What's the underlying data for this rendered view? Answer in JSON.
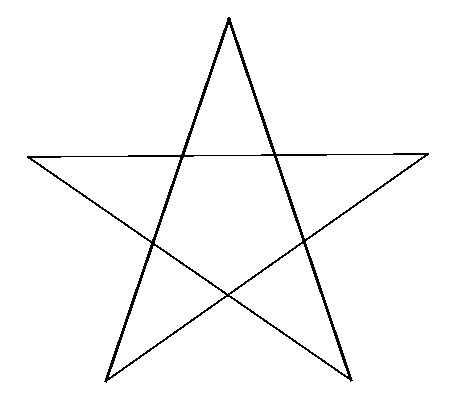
{
  "canvas": {
    "width": 449,
    "height": 408,
    "background": "#ffffff",
    "stroke_color": "#000000"
  },
  "star": {
    "points": {
      "top": [
        229,
        19
      ],
      "left": [
        28,
        157
      ],
      "right": [
        428,
        154
      ],
      "bottom_left": [
        106,
        381
      ],
      "bottom_right": [
        351,
        380
      ]
    },
    "segments": [
      {
        "name": "top-to-bottom-left",
        "from": "top",
        "to": "bottom_left",
        "width": 3
      },
      {
        "name": "top-to-bottom-right",
        "from": "top",
        "to": "bottom_right",
        "width": 3
      },
      {
        "name": "left-to-right",
        "from": "left",
        "to": "right",
        "width": 1.5
      },
      {
        "name": "left-to-bottom-right",
        "from": "left",
        "to": "bottom_right",
        "width": 2
      },
      {
        "name": "right-to-bottom-left",
        "from": "right",
        "to": "bottom_left",
        "width": 2
      }
    ]
  }
}
